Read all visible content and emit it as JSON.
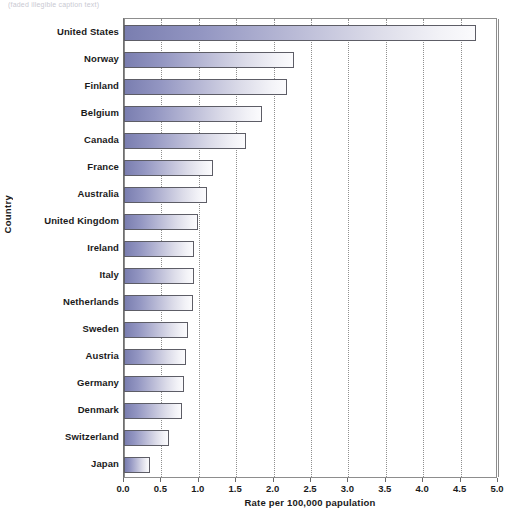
{
  "top_caption": "(faded illegible caption text)",
  "chart_data": {
    "type": "bar",
    "orientation": "horizontal",
    "title": "",
    "xlabel": "Rate per 100,000 papulation",
    "ylabel": "Country",
    "categories": [
      "United States",
      "Norway",
      "Finland",
      "Belgium",
      "Canada",
      "France",
      "Australia",
      "United Kingdom",
      "Ireland",
      "Italy",
      "Netherlands",
      "Sweden",
      "Austria",
      "Germany",
      "Denmark",
      "Switzerland",
      "Japan"
    ],
    "values": [
      4.7,
      2.27,
      2.18,
      1.85,
      1.63,
      1.19,
      1.11,
      0.99,
      0.94,
      0.94,
      0.92,
      0.86,
      0.83,
      0.8,
      0.78,
      0.6,
      0.35
    ],
    "xlim": [
      0,
      5
    ],
    "xticks": [
      "0.0",
      "0.5",
      "1.0",
      "1.5",
      "2.0",
      "2.5",
      "3.0",
      "3.5",
      "4.0",
      "4.5",
      "5.0"
    ],
    "xtick_values": [
      0,
      0.5,
      1,
      1.5,
      2,
      2.5,
      3,
      3.5,
      4,
      4.5,
      5
    ],
    "grid": "vertical-dotted",
    "legend": "none",
    "colors": {
      "bar_gradient_start": "#7a7eb0",
      "bar_gradient_end": "#fbfbfd",
      "bar_border": "#5d5d66",
      "gridline": "#8f8f8f",
      "frame": "#8d8d8d",
      "text": "#1a1a1a",
      "background": "#ffffff"
    }
  }
}
